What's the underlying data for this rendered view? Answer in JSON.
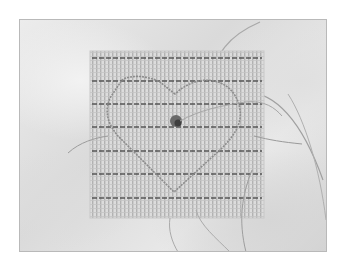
{
  "image": {
    "subject": "plastic canvas needlework with stitched heart outline",
    "palette": {
      "background": "#ffffff",
      "fabric": "#e2e2e2",
      "canvas": "#d8d8d8",
      "canvas_grid": "#b4b4b4",
      "stripe": "#5a5a5a",
      "heart_thread": "#8a8a8a",
      "knot": "#4a4a4a",
      "loose_thread": "#9a9a9a",
      "frame_border": "#b9b9b9"
    },
    "canvas_stripes_y": [
      38,
      61,
      84,
      107,
      131,
      154,
      178
    ]
  }
}
